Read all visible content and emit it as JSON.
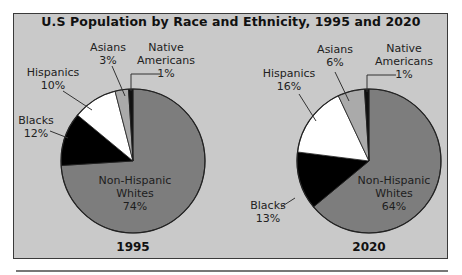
{
  "chart_data": {
    "type": "pie",
    "title": "U.S Population by Race and Ethnicity, 1995 and 2020",
    "colors": {
      "Non-Hispanic Whites": "#7d7d7d",
      "Blacks": "#000000",
      "Hispanics": "#ffffff",
      "Asians": "#aaaaaa",
      "Native Americans": "#111111",
      "background": "#c9c9c9"
    },
    "pies": [
      {
        "label": "1995",
        "slices": [
          {
            "name": "Non-Hispanic Whites",
            "value": 74
          },
          {
            "name": "Blacks",
            "value": 12
          },
          {
            "name": "Hispanics",
            "value": 10
          },
          {
            "name": "Asians",
            "value": 3
          },
          {
            "name": "Native Americans",
            "value": 1
          }
        ]
      },
      {
        "label": "2020",
        "slices": [
          {
            "name": "Non-Hispanic Whites",
            "value": 64
          },
          {
            "name": "Blacks",
            "value": 13
          },
          {
            "name": "Hispanics",
            "value": 16
          },
          {
            "name": "Asians",
            "value": 6
          },
          {
            "name": "Native Americans",
            "value": 1
          }
        ]
      }
    ]
  },
  "labels": {
    "p1995": {
      "whites": {
        "l1": "Non-Hispanic",
        "l2": "Whites",
        "pct": "74%"
      },
      "blacks": {
        "l1": "Blacks",
        "pct": "12%"
      },
      "hispanics": {
        "l1": "Hispanics",
        "pct": "10%"
      },
      "asians": {
        "l1": "Asians",
        "pct": "3%"
      },
      "native": {
        "l1": "Native",
        "l2": "Americans",
        "pct": "1%"
      },
      "year": "1995"
    },
    "p2020": {
      "whites": {
        "l1": "Non-Hispanic",
        "l2": "Whites",
        "pct": "64%"
      },
      "blacks": {
        "l1": "Blacks",
        "pct": "13%"
      },
      "hispanics": {
        "l1": "Hispanics",
        "pct": "16%"
      },
      "asians": {
        "l1": "Asians",
        "pct": "6%"
      },
      "native": {
        "l1": "Native",
        "l2": "Americans",
        "pct": "1%"
      },
      "year": "2020"
    }
  }
}
